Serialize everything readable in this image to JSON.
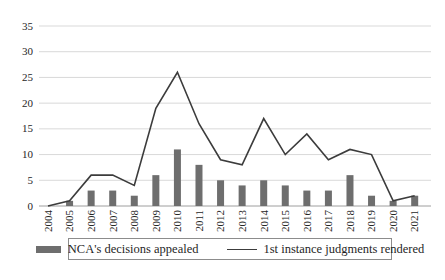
{
  "chart_data": {
    "type": "bar",
    "subtype": "combo-bar-line",
    "title": "",
    "xlabel": "",
    "ylabel": "",
    "categories": [
      "2004",
      "2005",
      "2006",
      "2007",
      "2008",
      "2009",
      "2010",
      "2011",
      "2012",
      "2013",
      "2014",
      "2015",
      "2016",
      "2017",
      "2018",
      "2019",
      "2020",
      "2021"
    ],
    "series": [
      {
        "name": "NCA's decisions appealed",
        "type": "bar",
        "color": "#6e6e6e",
        "values": [
          0,
          1,
          3,
          3,
          2,
          6,
          11,
          8,
          5,
          4,
          5,
          4,
          3,
          3,
          6,
          2,
          1,
          2
        ]
      },
      {
        "name": "1st instance judgments rendered",
        "type": "line",
        "color": "#3c3c3c",
        "values": [
          0,
          1,
          6,
          6,
          4,
          19,
          26,
          16,
          9,
          8,
          17,
          10,
          14,
          9,
          11,
          10,
          1,
          2
        ]
      }
    ],
    "ylim": [
      0,
      35
    ],
    "yticks": [
      0,
      5,
      10,
      15,
      20,
      25,
      30,
      35
    ],
    "grid": "horizontal",
    "gridline_color": "#d9d9d9",
    "axis_color": "#9e9e9e",
    "label_color": "#262626",
    "xtick_rotation": 90,
    "legend_position": "bottom",
    "legend_border": true
  }
}
